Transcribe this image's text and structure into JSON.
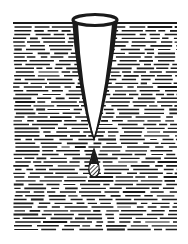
{
  "illustration": {
    "title": "",
    "subject": "funnel-in-liquid-with-drop",
    "colors": {
      "background": "#ffffff",
      "ink": "#1a1a1a"
    },
    "liquid": {
      "surface_y": 23,
      "left_x": 13,
      "right_x": 177,
      "bottom_y": 232,
      "row_spacing": 3.75
    },
    "funnel": {
      "rim": {
        "cx": 95,
        "cy": 20,
        "rx": 22,
        "ry": 5
      },
      "tip": {
        "x": 94,
        "y": 138
      }
    },
    "drop": {
      "cx": 94,
      "top_y": 150,
      "bottom_y": 176,
      "width": 10
    }
  }
}
